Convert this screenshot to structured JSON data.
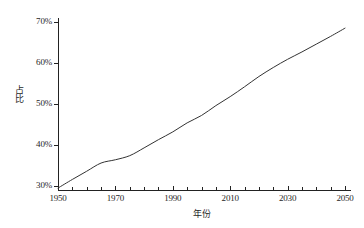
{
  "chart_data": {
    "type": "line",
    "title": "",
    "subtitle": "",
    "xlabel": "年份",
    "ylabel": "占比",
    "xlim": [
      1950,
      2050
    ],
    "ylim": [
      0.28,
      0.72
    ],
    "y_axis_display_range": [
      30,
      70
    ],
    "grid": false,
    "legend": false,
    "legend_position": "none",
    "x_tick_labels": [
      "1950",
      "1970",
      "1990",
      "2010",
      "2030",
      "2050"
    ],
    "x_tick_values": [
      1950,
      1970,
      1990,
      2010,
      2030,
      2050
    ],
    "x_minor_tick_interval": 5,
    "y_tick_labels": [
      "30%",
      "40%",
      "50%",
      "60%",
      "70%"
    ],
    "y_tick_values": [
      30,
      40,
      50,
      60,
      70
    ],
    "series": [
      {
        "name": "占比",
        "color": "#333333",
        "line_width": 1,
        "marker": "none",
        "x": [
          1950,
          1955,
          1960,
          1965,
          1970,
          1975,
          1980,
          1985,
          1990,
          1995,
          2000,
          2005,
          2010,
          2015,
          2020,
          2025,
          2030,
          2035,
          2040,
          2045,
          2050
        ],
        "values": [
          29.5,
          31.6,
          33.6,
          35.6,
          36.4,
          37.4,
          39.3,
          41.3,
          43.2,
          45.4,
          47.2,
          49.6,
          51.8,
          54.2,
          56.7,
          58.9,
          60.9,
          62.7,
          64.6,
          66.5,
          68.5
        ]
      }
    ],
    "annotations": []
  },
  "axes": {
    "y_title": "占比",
    "x_title": "年份"
  },
  "colors": {
    "line": "#333333",
    "axis": "#222222",
    "background": "#ffffff",
    "text": "#1f1f1f"
  }
}
